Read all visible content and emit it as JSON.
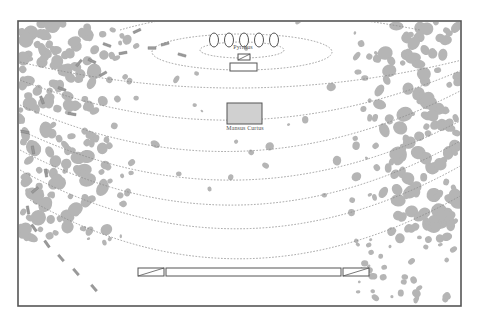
{
  "diagram": {
    "colors": {
      "frame": "#555555",
      "arc": "#8a8a8a",
      "blob": "#b5b5b5",
      "box_fill": "#d0d0d0",
      "unit_stroke": "#555555"
    },
    "frame": {
      "x": 18,
      "y": 21,
      "w": 443,
      "h": 285
    },
    "labels": {
      "top_label": "Pyrrhus",
      "center_label": "Mansus Curtus"
    },
    "top_ovals": {
      "count": 5,
      "cx": [
        214,
        229,
        244,
        259,
        274
      ],
      "cy": 40,
      "rx": 4.5,
      "ry": 7
    },
    "top_small_box": {
      "x": 238,
      "y": 54,
      "w": 12,
      "h": 6
    },
    "top_wide_box": {
      "x": 230,
      "y": 63,
      "w": 27,
      "h": 8
    },
    "center_box": {
      "x": 227,
      "y": 103,
      "w": 35,
      "h": 21
    },
    "bottom_bar": {
      "left_block": {
        "x": 138,
        "y": 268,
        "w": 26,
        "h": 8
      },
      "middle_block": {
        "x": 166,
        "y": 268,
        "w": 175,
        "h": 8
      },
      "right_block": {
        "x": 343,
        "y": 268,
        "w": 26,
        "h": 8
      }
    },
    "arcs": [
      {
        "type": "ellipse",
        "cx": 242,
        "cy": 50,
        "rx": 42,
        "ry": 8
      },
      {
        "type": "ellipse",
        "cx": 242,
        "cy": 52,
        "rx": 90,
        "ry": 18
      },
      {
        "type": "path",
        "d": "M 120 30 Q 240 -5 420 30"
      },
      {
        "type": "path",
        "d": "M 20 62 Q 240 115 462 60"
      },
      {
        "type": "path",
        "d": "M 20 80 Q 240 165 462 70"
      },
      {
        "type": "path",
        "d": "M 20 105 Q 240 205 462 90"
      },
      {
        "type": "path",
        "d": "M 20 130 Q 240 235 462 120"
      },
      {
        "type": "path",
        "d": "M 20 150 Q 240 265 462 140"
      },
      {
        "type": "path",
        "d": "M 20 170 Q 240 290 462 165"
      },
      {
        "type": "path",
        "d": "M 30 200 Q 240 320 462 195"
      }
    ],
    "marching_units": [
      {
        "x": 34,
        "y": 228,
        "a": 55
      },
      {
        "x": 47,
        "y": 244,
        "a": 55
      },
      {
        "x": 61,
        "y": 258,
        "a": 50
      },
      {
        "x": 76,
        "y": 272,
        "a": 50
      },
      {
        "x": 94,
        "y": 288,
        "a": 50
      },
      {
        "x": 28,
        "y": 210,
        "a": 80
      },
      {
        "x": 35,
        "y": 190,
        "a": -40
      },
      {
        "x": 46,
        "y": 173,
        "a": 80
      },
      {
        "x": 33,
        "y": 150,
        "a": 80
      },
      {
        "x": 42,
        "y": 100,
        "a": 70
      },
      {
        "x": 62,
        "y": 89,
        "a": 20
      },
      {
        "x": 79,
        "y": 63,
        "a": -50
      },
      {
        "x": 103,
        "y": 74,
        "a": -30
      },
      {
        "x": 107,
        "y": 45,
        "a": 20
      },
      {
        "x": 123,
        "y": 53,
        "a": -10
      },
      {
        "x": 92,
        "y": 61,
        "a": 25
      },
      {
        "x": 137,
        "y": 31,
        "a": -25
      },
      {
        "x": 152,
        "y": 48,
        "a": 0
      },
      {
        "x": 165,
        "y": 44,
        "a": -15
      },
      {
        "x": 182,
        "y": 55,
        "a": 15
      },
      {
        "x": 72,
        "y": 114,
        "a": 10
      },
      {
        "x": 25,
        "y": 132,
        "a": 10
      }
    ]
  }
}
